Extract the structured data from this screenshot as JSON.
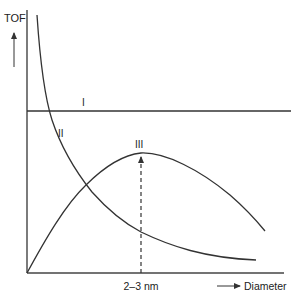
{
  "diagram": {
    "y_axis_label": "TOF",
    "x_axis_label": "Diameter",
    "x_marker_label": "2–3 nm",
    "curves": [
      {
        "id": "I",
        "label": "I",
        "description": "constant TOF, independent of diameter"
      },
      {
        "id": "II",
        "label": "II",
        "description": "TOF decreasing with diameter"
      },
      {
        "id": "III",
        "label": "III",
        "description": "TOF with maximum at 2-3 nm"
      }
    ],
    "colors": {
      "line": "#333333",
      "text": "#222222",
      "background": "#ffffff"
    }
  }
}
